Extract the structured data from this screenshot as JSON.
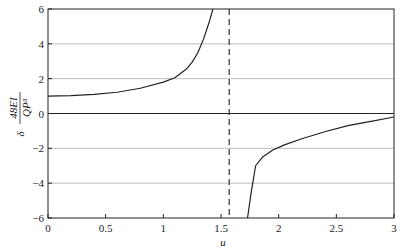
{
  "chart_data": {
    "type": "line",
    "title": "",
    "xlabel": "u",
    "ylabel": "δ 48EI / QP³",
    "ylabel_parts": {
      "prefix": "δ",
      "numerator": "48EI",
      "denominator": "QP³"
    },
    "xlim": [
      0,
      3
    ],
    "ylim": [
      -6,
      6
    ],
    "x_ticks": [
      0,
      0.5,
      1,
      1.5,
      2,
      2.5,
      3
    ],
    "x_tick_labels": [
      "0",
      "0.5",
      "1",
      "1.5",
      "2",
      "2.5",
      "3"
    ],
    "y_ticks": [
      -6,
      -4,
      -2,
      0,
      2,
      4,
      6
    ],
    "y_tick_labels": [
      "-6",
      "-4",
      "-2",
      "0",
      "2",
      "4",
      "6"
    ],
    "grid": {
      "horizontal": true,
      "vertical": false
    },
    "asymptote": {
      "x": 1.571,
      "style": "dashed",
      "label": ""
    },
    "zero_line": true,
    "series": [
      {
        "name": "left branch",
        "x": [
          0,
          0.2,
          0.4,
          0.6,
          0.8,
          1.0,
          1.1,
          1.2,
          1.25,
          1.3,
          1.35,
          1.4,
          1.43
        ],
        "y": [
          1.0,
          1.03,
          1.1,
          1.22,
          1.45,
          1.8,
          2.05,
          2.55,
          2.95,
          3.5,
          4.3,
          5.3,
          6.0
        ]
      },
      {
        "name": "right branch",
        "x": [
          1.73,
          1.76,
          1.8,
          1.86,
          1.95,
          2.05,
          2.2,
          2.4,
          2.6,
          2.8,
          3.0
        ],
        "y": [
          -6.0,
          -4.6,
          -3.0,
          -2.5,
          -2.1,
          -1.8,
          -1.45,
          -1.05,
          -0.7,
          -0.45,
          -0.2
        ]
      }
    ]
  }
}
